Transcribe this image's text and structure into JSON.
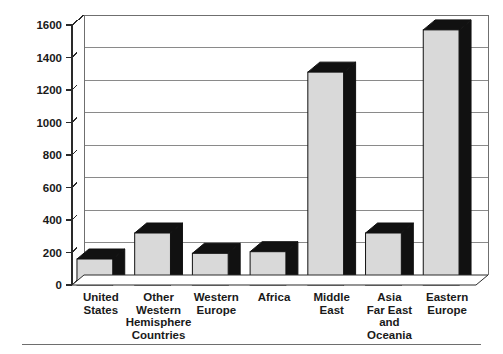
{
  "chart_data": {
    "type": "bar",
    "title": "",
    "subtitle": "",
    "xlabel": "",
    "ylabel": "",
    "ylim": [
      0,
      1600
    ],
    "ytick_step": 200,
    "grid": true,
    "legend": false,
    "legend_position": "none",
    "style": "3d-bar",
    "categories": [
      "United States",
      "Other Western Hemisphere Countries",
      "Western Europe",
      "Africa",
      "Middle East",
      "Asia Far East and Oceania",
      "Eastern Europe"
    ],
    "category_lines": [
      [
        "United",
        "States"
      ],
      [
        "Other",
        "Western",
        "Hemisphere",
        "Countries"
      ],
      [
        "Western",
        "Europe"
      ],
      [
        "Africa"
      ],
      [
        "Middle",
        "East"
      ],
      [
        "Asia",
        "Far East",
        "and",
        "Oceania"
      ],
      [
        "Eastern",
        "Europe"
      ]
    ],
    "values": [
      160,
      320,
      195,
      205,
      1310,
      320,
      1570
    ],
    "ytick_labels": [
      "0",
      "200",
      "400",
      "600",
      "800",
      "1000",
      "1200",
      "1400",
      "1600"
    ],
    "ytick_values": [
      0,
      200,
      400,
      600,
      800,
      1000,
      1200,
      1400,
      1600
    ]
  },
  "colors": {
    "bar_front": "#d9d9d9",
    "bar_side": "#111111",
    "bar_top": "#111111",
    "gridline": "#8a8a8a",
    "axis": "#2a2a2a",
    "background": "#ffffff",
    "text": "#1a1a1a",
    "footer_rule": "#6e6e6e"
  }
}
